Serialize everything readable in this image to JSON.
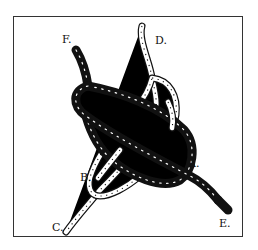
{
  "diagram": {
    "type": "knot-illustration",
    "frame": {
      "border_color": "#333333"
    },
    "ropes": [
      {
        "name": "dark-rope",
        "color": "#111111",
        "ends": [
          "F",
          "E"
        ]
      },
      {
        "name": "light-rope",
        "color": "#ffffff",
        "outline": "#111111",
        "ends": [
          "D",
          "C"
        ]
      }
    ],
    "labels": {
      "F": "F.",
      "D": "D.",
      "A": "A.",
      "B": "B.",
      "C": "C.",
      "E": "E."
    }
  }
}
